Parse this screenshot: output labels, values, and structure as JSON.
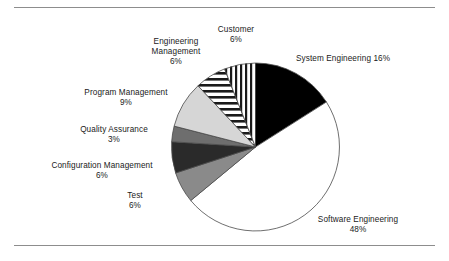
{
  "figure": {
    "background_color": "#ffffff",
    "rule_color": "#8d8d8d"
  },
  "chart_data": {
    "type": "pie",
    "title": "",
    "xlabel": "",
    "ylabel": "",
    "units": "percent",
    "start_angle_deg": 0,
    "direction": "clockwise",
    "legend_position": "none",
    "labels_position": "outside",
    "categories": [
      "System Engineering",
      "Software Engineering",
      "Test",
      "Configuration Management",
      "Quality Assurance",
      "Program Management",
      "Engineering Management",
      "Customer"
    ],
    "values": [
      16,
      48,
      6,
      6,
      3,
      9,
      6,
      6
    ],
    "total": 100,
    "slices": [
      {
        "name": "System Engineering",
        "label": "System Engineering 16%",
        "value": 16,
        "value_text": "16%",
        "fill": "#000000",
        "pattern": "solid",
        "start_deg": 0,
        "end_deg": 57.6
      },
      {
        "name": "Software Engineering",
        "label": "Software  Engineering",
        "value": 48,
        "value_text": "48%",
        "fill": "#ffffff",
        "pattern": "solid",
        "start_deg": 57.6,
        "end_deg": 230.4
      },
      {
        "name": "Test",
        "label": "Test",
        "value": 6,
        "value_text": "6%",
        "fill": "#8a8a8a",
        "pattern": "solid",
        "start_deg": 230.4,
        "end_deg": 252.0
      },
      {
        "name": "Configuration Management",
        "label": "Configuration Management",
        "value": 6,
        "value_text": "6%",
        "fill": "#2a2a2a",
        "pattern": "solid",
        "start_deg": 252.0,
        "end_deg": 273.6
      },
      {
        "name": "Quality Assurance",
        "label": "Quality  Assurance",
        "value": 3,
        "value_text": "3%",
        "fill": "#6e6e6e",
        "pattern": "solid",
        "start_deg": 273.6,
        "end_deg": 284.4
      },
      {
        "name": "Program Management",
        "label": "Program Management",
        "value": 9,
        "value_text": "9%",
        "fill": "#d6d6d6",
        "pattern": "solid",
        "start_deg": 284.4,
        "end_deg": 316.8
      },
      {
        "name": "Engineering Management",
        "label": "Engineering Management",
        "value": 6,
        "value_text": "6%",
        "fill": "#ffffff",
        "pattern": "horizontal-stripes",
        "start_deg": 316.8,
        "end_deg": 338.4
      },
      {
        "name": "Customer",
        "label": "Customer",
        "value": 6,
        "value_text": "6%",
        "fill": "#ffffff",
        "pattern": "vertical-stripes",
        "start_deg": 338.4,
        "end_deg": 360.0
      }
    ]
  },
  "labels": {
    "customer": {
      "line1": "Customer",
      "pct": "6%"
    },
    "engineering_management": {
      "line1": "Engineering",
      "line2": "Management",
      "pct": "6%"
    },
    "program_management": {
      "line1": "Program Management",
      "pct": "9%"
    },
    "quality_assurance": {
      "line1": "Quality  Assurance",
      "pct": "3%"
    },
    "configuration_management": {
      "line1": "Configuration Management",
      "pct": "6%"
    },
    "test": {
      "line1": "Test",
      "pct": "6%"
    },
    "system_engineering": {
      "line1": "System Engineering 16%"
    },
    "software_engineering": {
      "line1": "Software  Engineering",
      "pct": "48%"
    }
  }
}
